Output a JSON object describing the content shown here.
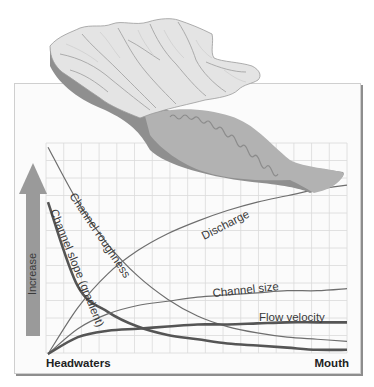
{
  "figure": {
    "arrow_label": "Increase",
    "x_start_label": "Headwaters",
    "x_end_label": "Mouth",
    "icons": {
      "drainage_basin": "terrain-relief-map-icon",
      "increase_arrow": "arrow-up-icon"
    },
    "colors": {
      "panel_bg": "#fbfbfb",
      "grid": "#d9d9d9",
      "curve": "#6e6e6e",
      "curve_thick": "#555555",
      "arrow": "#9a9a9a",
      "floodplain": "#b4b4b4",
      "terrain_light": "#e6e6e6",
      "terrain_dark": "#8a8a8a"
    }
  },
  "chart_data": {
    "type": "line",
    "title": "",
    "xlabel": "Headwaters → Mouth",
    "ylabel": "Increase",
    "x_tick_labels": [
      "Headwaters",
      "Mouth"
    ],
    "y_ticks": [],
    "grid": true,
    "legend": "inline labels on curves",
    "x": [
      0,
      0.1,
      0.2,
      0.3,
      0.4,
      0.5,
      0.6,
      0.7,
      0.8,
      0.9,
      1.0
    ],
    "xlim": [
      0,
      1
    ],
    "ylim": [
      0,
      1
    ],
    "series": [
      {
        "name": "Channel roughness",
        "style": "thin",
        "values": [
          0.98,
          0.72,
          0.52,
          0.37,
          0.26,
          0.18,
          0.13,
          0.1,
          0.08,
          0.07,
          0.06
        ]
      },
      {
        "name": "Channel slope (gradient)",
        "style": "thick",
        "values": [
          0.72,
          0.32,
          0.2,
          0.13,
          0.09,
          0.07,
          0.05,
          0.04,
          0.03,
          0.02,
          0.02
        ]
      },
      {
        "name": "Discharge",
        "style": "thin",
        "values": [
          0.0,
          0.22,
          0.38,
          0.49,
          0.57,
          0.63,
          0.68,
          0.72,
          0.75,
          0.78,
          0.8
        ]
      },
      {
        "name": "Channel size",
        "style": "thin",
        "values": [
          0.0,
          0.12,
          0.19,
          0.23,
          0.25,
          0.27,
          0.28,
          0.29,
          0.3,
          0.3,
          0.31
        ]
      },
      {
        "name": "Flow velocity",
        "style": "thick",
        "values": [
          0.0,
          0.08,
          0.11,
          0.12,
          0.13,
          0.14,
          0.14,
          0.145,
          0.15,
          0.15,
          0.15
        ]
      }
    ]
  }
}
